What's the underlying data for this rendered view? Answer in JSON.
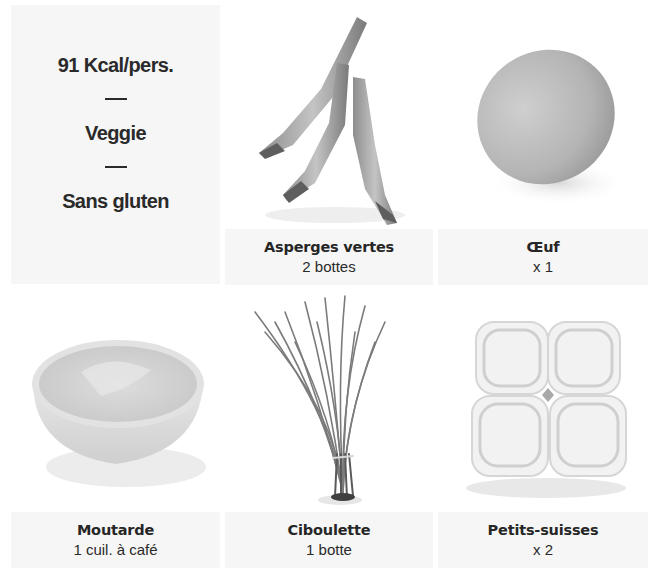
{
  "info": {
    "calories": "91 Kcal/pers.",
    "separator": "—",
    "diet": "Veggie",
    "allergen": "Sans gluten"
  },
  "ingredients": [
    {
      "name": "Asperges vertes",
      "quantity": "2 bottes",
      "image": "asparagus-photo"
    },
    {
      "name": "Œuf",
      "quantity": "x 1",
      "image": "egg-photo"
    },
    {
      "name": "Moutarde",
      "quantity": "1 cuil. à café",
      "image": "mustard-bowl-photo"
    },
    {
      "name": "Ciboulette",
      "quantity": "1 botte",
      "image": "chives-photo"
    },
    {
      "name": "Petits-suisses",
      "quantity": "x 2",
      "image": "petits-suisses-photo"
    }
  ],
  "colors": {
    "panel_bg": "#f6f6f6",
    "text": "#2a2a2a",
    "page_bg": "#ffffff"
  }
}
